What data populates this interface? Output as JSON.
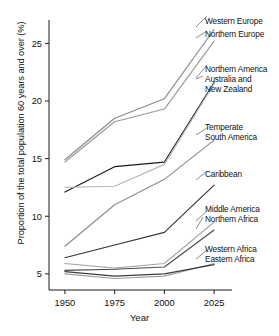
{
  "chart_data": {
    "type": "line",
    "title": "",
    "xlabel": "Year",
    "ylabel": "Proportion of the total population 60 years and over (%)",
    "x": [
      1950,
      1975,
      2000,
      2025
    ],
    "xticklabels": [
      "1950",
      "1975",
      "2000",
      "2025"
    ],
    "yticks": [
      5,
      10,
      15,
      20,
      25
    ],
    "yticklabels": [
      "5",
      "10",
      "15",
      "20",
      "25"
    ],
    "xlim": [
      1942,
      2034
    ],
    "ylim": [
      3.6,
      27.2
    ],
    "grid": false,
    "legend_position": "right-inline-labels",
    "series": [
      {
        "name": "Western Europe",
        "color": "#8a8a8a",
        "values": [
          14.9,
          18.5,
          20.2,
          26.2
        ]
      },
      {
        "name": "Northern Europe",
        "color": "#9a9a9a",
        "values": [
          14.7,
          18.2,
          19.3,
          25.2
        ]
      },
      {
        "name": "Northern America",
        "color": "#1a1a1a",
        "values": [
          12.1,
          14.3,
          14.7,
          21.6
        ]
      },
      {
        "name": "Australia and New Zealand",
        "color": "#b9b9b9",
        "values": [
          12.5,
          12.6,
          14.5,
          21.5
        ]
      },
      {
        "name": "Temperate South America",
        "color": "#8c8c8c",
        "values": [
          7.4,
          11.0,
          13.2,
          16.6
        ]
      },
      {
        "name": "Caribbean",
        "color": "#333333",
        "values": [
          6.4,
          7.5,
          8.6,
          12.7
        ]
      },
      {
        "name": "Middle America",
        "color": "#a8a8a8",
        "values": [
          5.9,
          5.5,
          5.9,
          9.5
        ]
      },
      {
        "name": "Northern Africa",
        "color": "#4a4a4a",
        "values": [
          5.3,
          5.4,
          5.6,
          8.8
        ]
      },
      {
        "name": "Western Africa",
        "color": "#9e9e9e",
        "values": [
          5.0,
          4.6,
          4.8,
          5.9
        ]
      },
      {
        "name": "Eastern Africa",
        "color": "#3d3d3d",
        "values": [
          5.2,
          4.8,
          5.0,
          5.8
        ]
      }
    ],
    "annotations": [
      {
        "text": "Western Europe",
        "x": 205,
        "y": 16
      },
      {
        "text": "Northern Europe",
        "x": 205,
        "y": 29
      },
      {
        "text": "Northern America",
        "x": 205,
        "y": 64
      },
      {
        "text": "Australia and",
        "x": 205,
        "y": 74
      },
      {
        "text": "New Zealand",
        "x": 205,
        "y": 84
      },
      {
        "text": "Temperate",
        "x": 205,
        "y": 122
      },
      {
        "text": "South America",
        "x": 205,
        "y": 132
      },
      {
        "text": "Caribbean",
        "x": 205,
        "y": 169
      },
      {
        "text": "Middle America",
        "x": 205,
        "y": 204
      },
      {
        "text": "Northern Africa",
        "x": 205,
        "y": 214
      },
      {
        "text": "Western Africa",
        "x": 205,
        "y": 244
      },
      {
        "text": "Eastern Africa",
        "x": 205,
        "y": 254
      }
    ],
    "leader_lines": [
      {
        "from": [
          196,
          27
        ],
        "to": [
          207,
          16
        ]
      },
      {
        "from": [
          196,
          38
        ],
        "to": [
          207,
          31
        ]
      },
      {
        "from": [
          196,
          78
        ],
        "to": [
          207,
          65
        ]
      },
      {
        "from": [
          196,
          79
        ],
        "to": [
          203,
          76
        ]
      },
      {
        "from": [
          196,
          135
        ],
        "to": [
          207,
          128
        ]
      },
      {
        "from": [
          196,
          180
        ],
        "to": [
          207,
          171
        ]
      },
      {
        "from": [
          196,
          221
        ],
        "to": [
          207,
          211
        ]
      },
      {
        "from": [
          196,
          229
        ],
        "to": [
          203,
          217
        ]
      },
      {
        "from": [
          196,
          259
        ],
        "to": [
          207,
          250
        ]
      }
    ]
  },
  "axes": {
    "plot_left": 49,
    "plot_right": 232,
    "plot_top": 18,
    "plot_bottom": 290
  }
}
